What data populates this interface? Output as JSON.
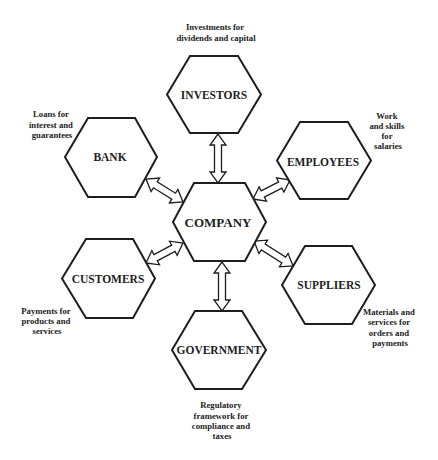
{
  "diagram": {
    "title": "",
    "center": {
      "id": "company",
      "label": "COMPANY"
    },
    "nodes": [
      {
        "id": "investors",
        "label": "INVESTORS",
        "annotation": [
          "Investments for",
          "dividends and capital"
        ]
      },
      {
        "id": "bank",
        "label": "BANK",
        "annotation": [
          "Loans for",
          "interest and",
          "guarantees"
        ]
      },
      {
        "id": "employees",
        "label": "EMPLOYEES",
        "annotation": [
          "Work",
          "and skills",
          "for",
          "salaries"
        ]
      },
      {
        "id": "customers",
        "label": "CUSTOMERS",
        "annotation": [
          "Payments for",
          "products and",
          "services"
        ]
      },
      {
        "id": "suppliers",
        "label": "SUPPLIERS",
        "annotation": [
          "Materials and",
          "services for",
          "orders and",
          "payments"
        ]
      },
      {
        "id": "government",
        "label": "GOVERNMENT",
        "annotation": [
          "Regulatory",
          "framework for",
          "compliance and",
          "taxes"
        ]
      }
    ],
    "connections": [
      {
        "from": "COMPANY",
        "to": "INVESTORS",
        "type": "bidirectional-arrow"
      },
      {
        "from": "COMPANY",
        "to": "BANK",
        "type": "bidirectional-arrow"
      },
      {
        "from": "COMPANY",
        "to": "EMPLOYEES",
        "type": "bidirectional-arrow"
      },
      {
        "from": "COMPANY",
        "to": "CUSTOMERS",
        "type": "bidirectional-arrow"
      },
      {
        "from": "COMPANY",
        "to": "SUPPLIERS",
        "type": "bidirectional-arrow"
      },
      {
        "from": "COMPANY",
        "to": "GOVERNMENT",
        "type": "bidirectional-arrow"
      }
    ],
    "colors": {
      "stroke": "#1e1e1e",
      "fill": "#ffffff",
      "text": "#1e1e1e"
    }
  }
}
